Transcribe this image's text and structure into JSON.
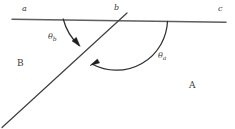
{
  "figure": {
    "type": "geometry-diagram",
    "stroke_color": "#4a4a4a",
    "line_color": "#5a5a5a",
    "text_color": "#3a3a3a",
    "background": "#ffffff"
  },
  "points": {
    "a": {
      "label": "a",
      "x": 22,
      "y": 9
    },
    "b": {
      "label": "b",
      "x": 115,
      "y": 8
    },
    "c": {
      "label": "c",
      "x": 219,
      "y": 9
    }
  },
  "regions": {
    "upper_left": {
      "label": "B",
      "x": 18,
      "y": 63
    },
    "lower_right": {
      "label": "A",
      "x": 190,
      "y": 85
    }
  },
  "angles": {
    "theta_b": {
      "symbol": "θ",
      "subscript": "b",
      "x": 50,
      "y": 37
    },
    "theta_a": {
      "symbol": "θ",
      "subscript": "a",
      "x": 160,
      "y": 55
    }
  },
  "geometry": {
    "horizontal_line": {
      "x1": 12,
      "y1": 19,
      "x2": 226,
      "y2": 22
    },
    "transversal_line": {
      "x1": 2,
      "y1": 127,
      "x2": 127,
      "y2": 13
    },
    "vertex": {
      "x": 118,
      "y": 20
    },
    "small_arc": {
      "start_x": 63,
      "start_y": 19,
      "end_x": 77,
      "end_y": 44,
      "radius": 56
    },
    "large_arc": {
      "start_x": 167,
      "start_y": 21,
      "end_x": 90,
      "end_y": 65,
      "radius": 52
    },
    "arrowheads": 2
  }
}
